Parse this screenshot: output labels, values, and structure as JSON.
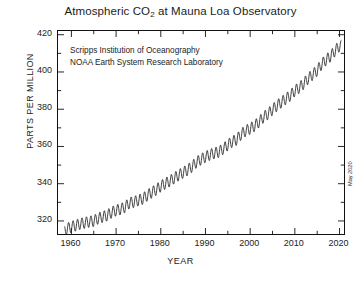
{
  "chart_data": {
    "type": "line",
    "title": "Atmospheric CO2 at Mauna Loa Observatory",
    "title_main": "Atmospheric CO",
    "title_sub": "2",
    "title_tail": " at Mauna Loa Observatory",
    "xlabel": "YEAR",
    "ylabel": "PARTS PER MILLION",
    "xlim": [
      1957,
      2021
    ],
    "ylim": [
      313,
      422
    ],
    "xticks": [
      1960,
      1970,
      1980,
      1990,
      2000,
      2010,
      2020
    ],
    "xticks_minor_step": 5,
    "yticks": [
      320,
      340,
      360,
      380,
      400,
      420
    ],
    "yticks_minor_step": 10,
    "grid": false,
    "legend": "none",
    "annotations": [
      "Scripps Institution of Oceanography",
      "NOAA Earth System Research Laboratory"
    ],
    "datestamp": "May 2020",
    "line_color": "#1a1a1a",
    "series_name": "Monthly mean CO2 concentration",
    "seasonal_amplitude_ppm": 6.0,
    "x": [
      1958.5,
      1959,
      1960,
      1961,
      1962,
      1963,
      1964,
      1965,
      1966,
      1967,
      1968,
      1969,
      1970,
      1971,
      1972,
      1973,
      1974,
      1975,
      1976,
      1977,
      1978,
      1979,
      1980,
      1981,
      1982,
      1983,
      1984,
      1985,
      1986,
      1987,
      1988,
      1989,
      1990,
      1991,
      1992,
      1993,
      1994,
      1995,
      1996,
      1997,
      1998,
      1999,
      2000,
      2001,
      2002,
      2003,
      2004,
      2005,
      2006,
      2007,
      2008,
      2009,
      2010,
      2011,
      2012,
      2013,
      2014,
      2015,
      2016,
      2017,
      2018,
      2019,
      2020
    ],
    "values": [
      315.0,
      315.8,
      316.9,
      317.6,
      318.5,
      319.0,
      319.6,
      320.0,
      321.4,
      322.2,
      323.0,
      324.6,
      325.7,
      326.3,
      327.5,
      329.7,
      330.2,
      331.1,
      332.0,
      333.8,
      335.4,
      336.8,
      338.7,
      340.1,
      341.4,
      343.0,
      344.6,
      346.0,
      347.4,
      349.2,
      351.6,
      353.1,
      354.4,
      355.6,
      356.4,
      357.1,
      358.8,
      360.8,
      362.6,
      363.7,
      366.6,
      368.4,
      369.6,
      371.1,
      373.2,
      375.8,
      377.5,
      379.8,
      381.9,
      383.8,
      385.6,
      387.4,
      389.9,
      391.6,
      393.8,
      396.5,
      398.6,
      400.8,
      404.2,
      406.5,
      408.5,
      411.4,
      414.0
    ]
  }
}
